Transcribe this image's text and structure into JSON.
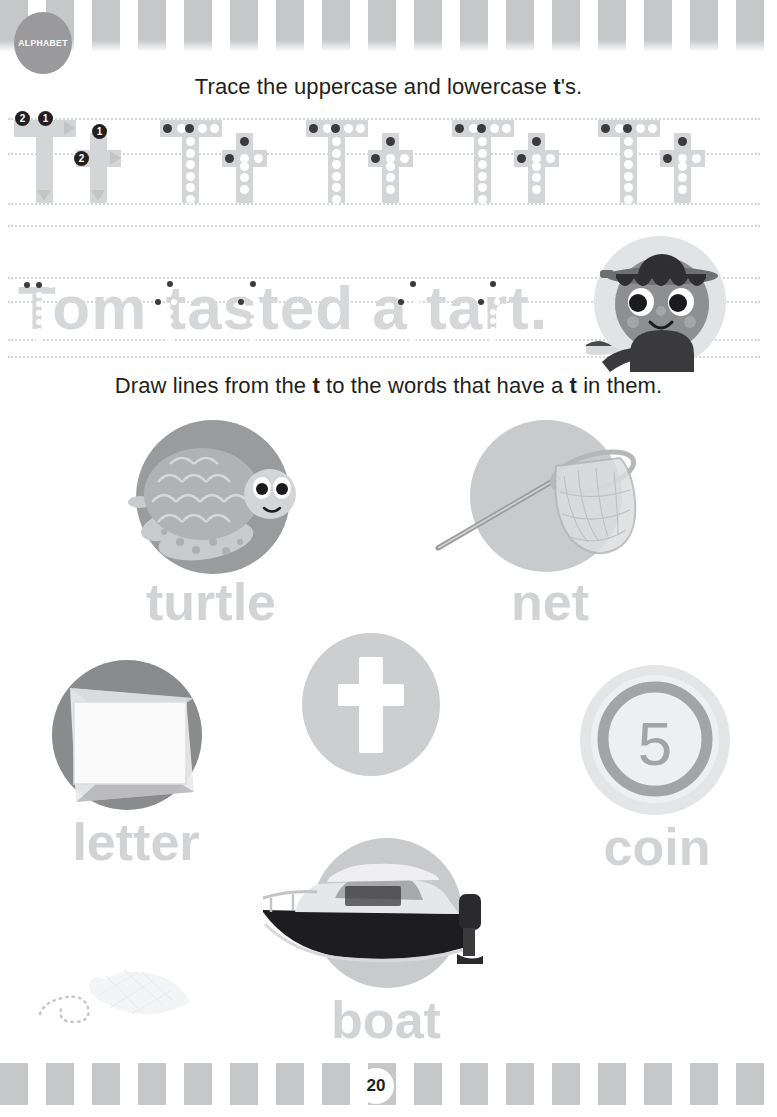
{
  "page": {
    "subject_badge": "ALPHABET",
    "page_number": "20",
    "letter": "t",
    "background_color": "#ffffff",
    "stripe_color": "#c6c7c9",
    "accent_gray": "#9a9a9c"
  },
  "instructions": {
    "line1_pre": "Trace the uppercase and lowercase ",
    "line1_bold": "t",
    "line1_post": "'s.",
    "line2_pre": "Draw lines from the ",
    "line2_bold1": "t",
    "line2_mid": " to the words that have a ",
    "line2_bold2": "t",
    "line2_post": " in them."
  },
  "trace_row": {
    "stroke_numbers": [
      "1",
      "2"
    ],
    "uppercase": "T",
    "lowercase": "t",
    "pairs": 5,
    "guide_color": "#d4d5d7",
    "dot_color": "#ffffff",
    "start_dot_color": "#3b3b3d"
  },
  "sentence_trace": {
    "text": "Tom tasted a tart.",
    "words": [
      "Tom",
      "tasted",
      "a",
      "tart."
    ],
    "trace_letters": [
      "T",
      "t",
      "t",
      "t"
    ],
    "text_color": "#d6d7d9"
  },
  "character": {
    "name": "tom-chef",
    "description": "boy chef holding a tart",
    "hat_color": "#6e6f71",
    "face_color": "#8e8f91",
    "shirt_color": "#3a3a3c"
  },
  "word_tiles": [
    {
      "label": "turtle",
      "image": "turtle-illustration",
      "circle_color": "#9a9b9d",
      "has_t": true
    },
    {
      "label": "net",
      "image": "net-photo",
      "circle_color": "#c9cacc",
      "has_t": true
    },
    {
      "label": "letter",
      "image": "envelope-photo",
      "circle_color": "#8a8b8d",
      "has_t": true
    },
    {
      "label": "coin",
      "image": "coin-photo",
      "circle_color": "#e4e5e7",
      "has_t": false
    },
    {
      "label": "boat",
      "image": "boat-photo",
      "circle_color": "#c9cacc",
      "has_t": true
    }
  ],
  "hub": {
    "letter": "t",
    "circle_color": "#cdced0",
    "letter_color": "#ffffff"
  },
  "coin": {
    "value": "5"
  },
  "watermark": {
    "name": "bird-doodle"
  }
}
